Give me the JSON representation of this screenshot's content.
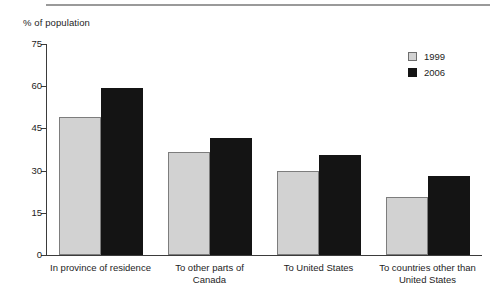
{
  "chart_data": {
    "type": "bar",
    "title": "",
    "subtitle": "",
    "xlabel": "",
    "ylabel": "% of population",
    "ylim": [
      0,
      75
    ],
    "yticks": [
      0,
      15,
      30,
      45,
      60,
      75
    ],
    "ytick_labels": [
      "0",
      "15",
      "30",
      "45",
      "60",
      "75"
    ],
    "grid": false,
    "legend_position": "top-right",
    "categories": [
      "In province of residence",
      "To other parts of\nCanada",
      "To United States",
      "To countries other than\nUnited States"
    ],
    "series": [
      {
        "name": "1999",
        "color": "#d2d2d2",
        "values": [
          49.0,
          36.5,
          30.0,
          20.5
        ]
      },
      {
        "name": "2006",
        "color": "#141414",
        "values": [
          59.5,
          41.5,
          35.5,
          28.0
        ]
      }
    ]
  },
  "legend": {
    "items": [
      {
        "label": "1999",
        "swatch": "legend-swatch-1999"
      },
      {
        "label": "2006",
        "swatch": "legend-swatch-2006"
      }
    ]
  }
}
